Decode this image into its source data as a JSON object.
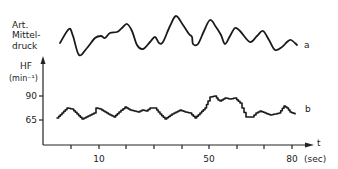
{
  "chart_data": {
    "type": "line",
    "title": "",
    "xlabel": "t (sec)",
    "x_axis_arrow_label": "t",
    "x_unit": "(sec)",
    "x_ticks": [
      {
        "pos": 71,
        "label": ""
      },
      {
        "pos": 99,
        "label": "10"
      },
      {
        "pos": 126,
        "label": ""
      },
      {
        "pos": 154,
        "label": ""
      },
      {
        "pos": 182,
        "label": ""
      },
      {
        "pos": 209,
        "label": "50"
      },
      {
        "pos": 237,
        "label": ""
      },
      {
        "pos": 264,
        "label": ""
      },
      {
        "pos": 292,
        "label": "80"
      }
    ],
    "y_axis": {
      "label_line1": "HF",
      "label_line2": "(min⁻¹)",
      "ticks": [
        {
          "value": "90",
          "pos": 96
        },
        {
          "value": "65",
          "pos": 120
        }
      ]
    },
    "grid": false,
    "series": [
      {
        "name": "a",
        "description": "Art. Mitteldruck (mean arterial pressure), no numeric scale",
        "label_lines": [
          "Art.",
          "Mittel-",
          "druck"
        ],
        "marker": "a",
        "points": [
          [
            60,
            43
          ],
          [
            69,
            29
          ],
          [
            73,
            36
          ],
          [
            79,
            55
          ],
          [
            87,
            48
          ],
          [
            95,
            38
          ],
          [
            101,
            36
          ],
          [
            105,
            38
          ],
          [
            110,
            33
          ],
          [
            117,
            32
          ],
          [
            122,
            28
          ],
          [
            127,
            24
          ],
          [
            132,
            31
          ],
          [
            137,
            45
          ],
          [
            143,
            49
          ],
          [
            150,
            42
          ],
          [
            155,
            37
          ],
          [
            159,
            43
          ],
          [
            163,
            42
          ],
          [
            170,
            26
          ],
          [
            176,
            16
          ],
          [
            183,
            25
          ],
          [
            189,
            34
          ],
          [
            192,
            37
          ],
          [
            193,
            44
          ],
          [
            198,
            44
          ],
          [
            204,
            31
          ],
          [
            210,
            20
          ],
          [
            216,
            27
          ],
          [
            221,
            35
          ],
          [
            225,
            44
          ],
          [
            230,
            36
          ],
          [
            235,
            28
          ],
          [
            240,
            31
          ],
          [
            250,
            42
          ],
          [
            257,
            36
          ],
          [
            263,
            31
          ],
          [
            269,
            40
          ],
          [
            275,
            50
          ],
          [
            282,
            47
          ],
          [
            287,
            42
          ],
          [
            291,
            40
          ],
          [
            297,
            45
          ]
        ]
      },
      {
        "name": "b",
        "description": "HF (heart rate, min^-1), step trace",
        "marker": "b",
        "points": [
          [
            57,
            118
          ],
          [
            62,
            113
          ],
          [
            67,
            108
          ],
          [
            72,
            109
          ],
          [
            77,
            114
          ],
          [
            82,
            119
          ],
          [
            88,
            116
          ],
          [
            94,
            113
          ],
          [
            96,
            108
          ],
          [
            100,
            109
          ],
          [
            105,
            112
          ],
          [
            110,
            115
          ],
          [
            114,
            117
          ],
          [
            119,
            112
          ],
          [
            125,
            107
          ],
          [
            130,
            110
          ],
          [
            134,
            111
          ],
          [
            138,
            112
          ],
          [
            142,
            110
          ],
          [
            146,
            111
          ],
          [
            150,
            108
          ],
          [
            155,
            108
          ],
          [
            160,
            114
          ],
          [
            165,
            119
          ],
          [
            172,
            114
          ],
          [
            180,
            110
          ],
          [
            185,
            112
          ],
          [
            190,
            113
          ],
          [
            195,
            118
          ],
          [
            200,
            113
          ],
          [
            205,
            108
          ],
          [
            208,
            101
          ],
          [
            210,
            97
          ],
          [
            215,
            96
          ],
          [
            218,
            100
          ],
          [
            220,
            101
          ],
          [
            225,
            98
          ],
          [
            230,
            99
          ],
          [
            235,
            98
          ],
          [
            240,
            103
          ],
          [
            242,
            108
          ],
          [
            246,
            117
          ],
          [
            252,
            117
          ],
          [
            256,
            113
          ],
          [
            260,
            111
          ],
          [
            265,
            113
          ],
          [
            270,
            115
          ],
          [
            275,
            114
          ],
          [
            279,
            113
          ],
          [
            284,
            106
          ],
          [
            287,
            108
          ],
          [
            290,
            112
          ],
          [
            295,
            114
          ]
        ]
      }
    ]
  }
}
